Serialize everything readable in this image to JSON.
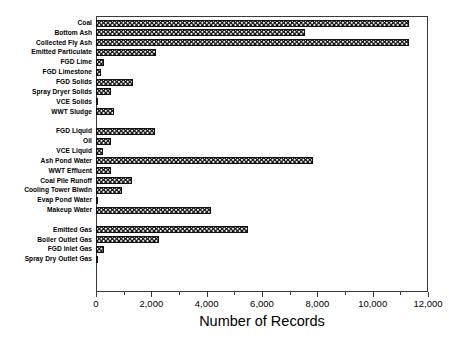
{
  "chart_data": {
    "type": "bar",
    "orientation": "horizontal",
    "title": "",
    "xlabel": "Number of Records",
    "ylabel": "",
    "xlim": [
      0,
      12000
    ],
    "xticks": [
      0,
      2000,
      4000,
      6000,
      8000,
      10000,
      12000
    ],
    "xticklabels": [
      "0",
      "2,000",
      "4,000",
      "6,000",
      "8,000",
      "10,000",
      "12,000"
    ],
    "minor_tick_interval": 1000,
    "grid": false,
    "legend": false,
    "bar_fill": "cross-hatch-diamond",
    "bar_edge_color": "#101010",
    "bar_face_color": "#ffffff",
    "categories": [
      "Coal",
      "Bottom Ash",
      "Collected Fly Ash",
      "Emitted Particulate",
      "FGD Lime",
      "FGD Limestone",
      "FGD Solids",
      "Spray Dryer Solids",
      "VCE Solids",
      "WWT Sludge",
      "FGD Liquid",
      "Oil",
      "VCE Liquid",
      "Ash Pond Water",
      "WWT Effluent",
      "Coal Pile Runoff",
      "Cooling Tower Blwdn",
      "Evap Pond Water",
      "Makeup Water",
      "Emitted Gas",
      "Boiler Outlet Gas",
      "FGD Inlet Gas",
      "Spray Dry Outlet Gas"
    ],
    "values": [
      11300,
      7550,
      11300,
      2170,
      290,
      180,
      1340,
      540,
      70,
      650,
      2140,
      540,
      250,
      7830,
      540,
      1300,
      940,
      70,
      4150,
      5480,
      2280,
      290,
      60
    ],
    "groups": [
      {
        "name": "solids",
        "categories": [
          "Coal",
          "Bottom Ash",
          "Collected Fly Ash",
          "Emitted Particulate",
          "FGD Lime",
          "FGD Limestone",
          "FGD Solids",
          "Spray Dryer Solids",
          "VCE Solids",
          "WWT Sludge"
        ]
      },
      {
        "name": "liquids",
        "categories": [
          "FGD Liquid",
          "Oil",
          "VCE Liquid",
          "Ash Pond Water",
          "WWT Effluent",
          "Coal Pile Runoff",
          "Cooling Tower Blwdn",
          "Evap Pond Water",
          "Makeup Water"
        ]
      },
      {
        "name": "gases",
        "categories": [
          "Emitted Gas",
          "Boiler Outlet Gas",
          "FGD Inlet Gas",
          "Spray Dry Outlet Gas"
        ]
      }
    ]
  }
}
